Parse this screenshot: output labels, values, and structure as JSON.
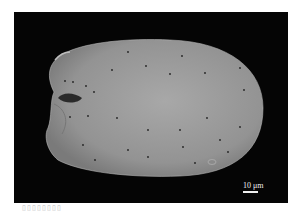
{
  "image": {
    "type": "SEM micrograph",
    "subject": "ovoid specimen with small pores and a notch on the left side",
    "background_color": "#050505",
    "specimen_color": "#9a9a9a"
  },
  "scale_bar": {
    "label": "10 μm"
  },
  "caption": {
    "text": "▯▯▯▯▯▯▯▯"
  }
}
